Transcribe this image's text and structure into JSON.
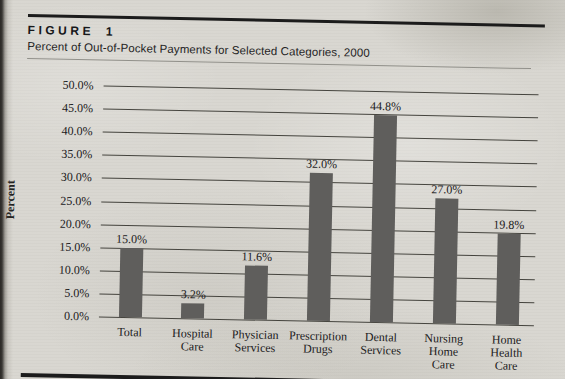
{
  "figure": {
    "label": "FIGURE 1",
    "subtitle": "Percent of Out-of-Pocket Payments for Selected Categories, 2000"
  },
  "chart_data": {
    "type": "bar",
    "title": "Percent of Out-of-Pocket Payments for Selected Categories, 2000",
    "figure_number": "FIGURE 1",
    "xlabel": "",
    "ylabel": "Percent",
    "categories": [
      "Total",
      "Hospital Care",
      "Physician Services",
      "Prescription Drugs",
      "Dental Services",
      "Nursing Home Care",
      "Home Health Care"
    ],
    "category_lines": [
      [
        "Total"
      ],
      [
        "Hospital",
        "Care"
      ],
      [
        "Physician",
        "Services"
      ],
      [
        "Prescription",
        "Drugs"
      ],
      [
        "Dental",
        "Services"
      ],
      [
        "Nursing",
        "Home",
        "Care"
      ],
      [
        "Home",
        "Health",
        "Care"
      ]
    ],
    "values": [
      15.0,
      3.2,
      11.6,
      32.0,
      44.8,
      27.0,
      19.8
    ],
    "data_labels": [
      "15.0%",
      "3.2%",
      "11.6%",
      "32.0%",
      "44.8%",
      "27.0%",
      "19.8%"
    ],
    "ylim": [
      0,
      50
    ],
    "ytick_step": 5,
    "ytick_labels": [
      "0.0%",
      "5.0%",
      "10.0%",
      "15.0%",
      "20.0%",
      "25.0%",
      "30.0%",
      "35.0%",
      "40.0%",
      "45.0%",
      "50.0%"
    ],
    "grid": true,
    "legend_position": "none",
    "colors": {
      "bar": "#5f5e5c",
      "gridline": "#45443e",
      "text": "#21201c",
      "rule": "#1c1c1c",
      "paper": "#d8d6d0"
    }
  }
}
